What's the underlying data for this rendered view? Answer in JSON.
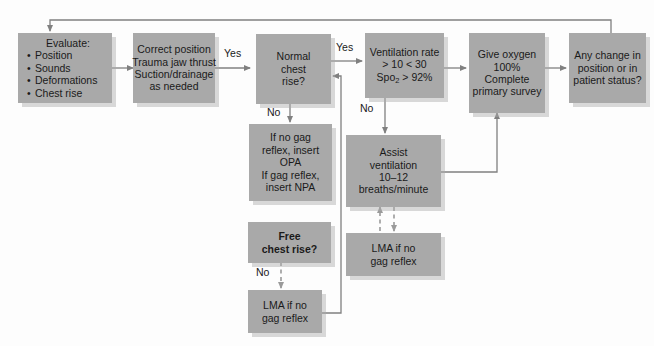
{
  "diagram": {
    "box_fill": "#a9a9a9",
    "line_color": "#808080",
    "text_color": "#1a1a1a",
    "background": "#fdfdfd"
  },
  "nodes": {
    "evaluate": {
      "heading": "Evaluate:",
      "bullets": [
        "Position",
        "Sounds",
        "Deformations",
        "Chest rise"
      ]
    },
    "correct_position": {
      "lines": [
        "Correct position",
        "Trauma jaw thrust",
        "Suction/drainage",
        "as needed"
      ]
    },
    "normal_chest_rise": {
      "lines": [
        "Normal",
        "chest",
        "rise?"
      ]
    },
    "airway_adjunct": {
      "lines": [
        "If no gag",
        "reflex, insert",
        "OPA",
        "If gag reflex,",
        "insert NPA"
      ]
    },
    "ventilation_rate": {
      "lines": [
        "Ventilation rate",
        "> 10 < 30"
      ],
      "spo2_label": "Spo",
      "spo2_sub": "2",
      "spo2_value": "> 92%"
    },
    "assist_ventilation": {
      "lines": [
        "Assist",
        "ventilation",
        "10–12",
        "breaths/minute"
      ]
    },
    "lma_right": {
      "lines": [
        "LMA if no",
        "gag reflex"
      ]
    },
    "give_oxygen": {
      "lines": [
        "Give oxygen",
        "100%",
        "Complete",
        "primary survey"
      ]
    },
    "any_change": {
      "lines": [
        "Any change in",
        "position or in",
        "patient status?"
      ]
    },
    "free_chest_rise": {
      "lines": [
        "Free",
        "chest rise?"
      ]
    },
    "lma_bottom": {
      "lines": [
        "LMA if no",
        "gag reflex"
      ]
    }
  },
  "edge_labels": {
    "yes_1": "Yes",
    "yes_2": "Yes",
    "no_chest_rise": "No",
    "no_ventilation": "No",
    "no_free_chest_rise": "No"
  }
}
